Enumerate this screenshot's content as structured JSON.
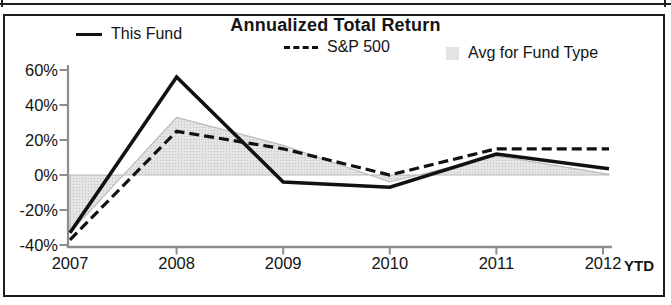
{
  "chart_data": {
    "type": "line",
    "title": "Annualized Total Return",
    "categories": [
      "2007",
      "2008",
      "2009",
      "2010",
      "2011",
      "2012"
    ],
    "x_suffix_label": "YTD",
    "y_ticks": [
      "60%",
      "40%",
      "20%",
      "0%",
      "-20%",
      "-40%"
    ],
    "y_tick_values": [
      60,
      40,
      20,
      0,
      -20,
      -40
    ],
    "ylim": [
      -44,
      64
    ],
    "grid": false,
    "legend_position": "top",
    "axis_color": "#8d8d8d",
    "line_color": "#111111",
    "area_fill_color": "#e0e0e0",
    "area_edge_color": "#b9b9b9",
    "series": [
      {
        "name": "This Fund",
        "type": "line",
        "style": "solid",
        "values": [
          -33,
          56,
          -4,
          -7,
          12,
          4
        ]
      },
      {
        "name": "S&P 500",
        "type": "line",
        "style": "dashed",
        "values": [
          -37,
          25,
          15,
          0,
          15,
          15
        ]
      },
      {
        "name": "Avg for Fund Type",
        "type": "area",
        "style": "filled",
        "values": [
          -33,
          33,
          17,
          -4,
          11,
          1
        ]
      }
    ]
  }
}
